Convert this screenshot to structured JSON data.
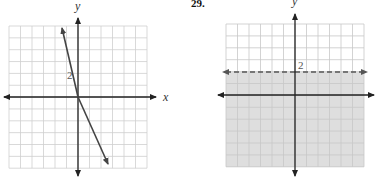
{
  "chart_data": [
    {
      "type": "line",
      "problem_number": "",
      "title": "",
      "xlabel": "x",
      "ylabel": "y",
      "tick_labels": [
        {
          "axis": "y",
          "value": 2,
          "label": "2"
        }
      ],
      "grid": true,
      "xlim": [
        -6,
        6
      ],
      "ylim": [
        -6,
        6
      ],
      "series": [
        {
          "name": "line",
          "equation": "y = -3x + 2",
          "slope": -3,
          "intercept": 2,
          "style": "solid",
          "arrows": "both",
          "x": [
            -1.3,
            2.5
          ],
          "y": [
            5.9,
            -5.5
          ]
        }
      ]
    },
    {
      "type": "area",
      "problem_number": "29.",
      "title": "",
      "xlabel": "",
      "ylabel": "y",
      "tick_labels": [
        {
          "axis": "y",
          "value": 2,
          "label": "2"
        }
      ],
      "grid": true,
      "xlim": [
        -6,
        6
      ],
      "ylim": [
        -6,
        6
      ],
      "series": [
        {
          "name": "boundary",
          "equation": "y = 2",
          "style": "dashed",
          "arrows": "both",
          "x": [
            -6,
            6
          ],
          "y": [
            2,
            2
          ]
        },
        {
          "name": "shaded-region",
          "inequality": "y < 2",
          "fill": "#dedede",
          "y_range": [
            -6,
            2
          ]
        }
      ]
    }
  ],
  "left_graph": {
    "y_label": "y",
    "x_label": "x",
    "tick_2": "2"
  },
  "right_graph": {
    "problem_number": "29.",
    "y_label": "y",
    "tick_2": "2"
  },
  "colors": {
    "grid": "#c8c8c8",
    "axis": "#222222",
    "shade": "#dedede",
    "line": "#444444"
  }
}
